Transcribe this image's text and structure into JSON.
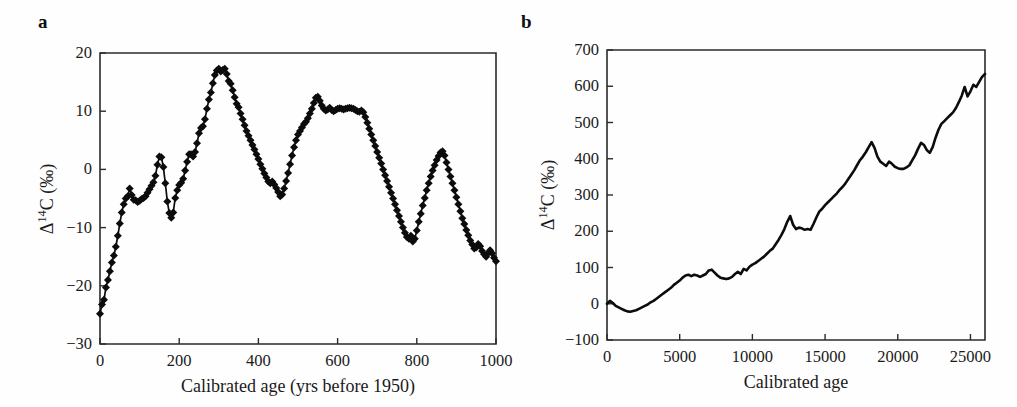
{
  "figure": {
    "background_color": "#fefefe",
    "line_color": "#0c0c0c",
    "axis_color": "#2b2b2b"
  },
  "panels": {
    "a": {
      "label": "a",
      "xlabel": "Calibrated age (yrs before 1950)",
      "ylabel_prefix": "Δ",
      "ylabel_sup": "14",
      "ylabel_suffix": "C (‰)",
      "ylabel_full": "Δ14C (‰)"
    },
    "b": {
      "label": "b",
      "xlabel": "Calibrated age",
      "ylabel_prefix": "Δ",
      "ylabel_sup": "14",
      "ylabel_suffix": "C (‰)",
      "ylabel_full": "Δ14C (‰)"
    }
  },
  "chart_data": [
    {
      "id": "panel-a",
      "type": "line",
      "title": "a",
      "xlabel": "Calibrated age (yrs before 1950)",
      "ylabel": "Δ14C (‰)",
      "xlim": [
        0,
        1000
      ],
      "ylim": [
        -30,
        20
      ],
      "xticks": [
        0,
        200,
        400,
        600,
        800,
        1000
      ],
      "yticks": [
        -30,
        -20,
        -10,
        0,
        10,
        20
      ],
      "grid": false,
      "legend": null,
      "markers": "filled-diamond",
      "marker_size_px": 4,
      "series": [
        {
          "name": "Delta14C tree-ring record",
          "x": [
            0,
            5,
            10,
            15,
            20,
            25,
            30,
            35,
            40,
            45,
            50,
            55,
            60,
            65,
            70,
            75,
            80,
            85,
            90,
            95,
            100,
            105,
            110,
            115,
            120,
            125,
            130,
            135,
            140,
            145,
            150,
            155,
            160,
            165,
            170,
            175,
            180,
            185,
            190,
            195,
            200,
            205,
            210,
            215,
            220,
            225,
            230,
            235,
            240,
            245,
            250,
            255,
            260,
            265,
            270,
            275,
            280,
            285,
            290,
            295,
            300,
            305,
            310,
            315,
            320,
            325,
            330,
            335,
            340,
            345,
            350,
            355,
            360,
            365,
            370,
            375,
            380,
            385,
            390,
            395,
            400,
            405,
            410,
            415,
            420,
            425,
            430,
            435,
            440,
            445,
            450,
            455,
            460,
            465,
            470,
            475,
            480,
            485,
            490,
            495,
            500,
            505,
            510,
            515,
            520,
            525,
            530,
            535,
            540,
            545,
            550,
            555,
            560,
            565,
            570,
            575,
            580,
            585,
            590,
            595,
            600,
            605,
            610,
            615,
            620,
            625,
            630,
            635,
            640,
            645,
            650,
            655,
            660,
            665,
            670,
            675,
            680,
            685,
            690,
            695,
            700,
            705,
            710,
            715,
            720,
            725,
            730,
            735,
            740,
            745,
            750,
            755,
            760,
            765,
            770,
            775,
            780,
            785,
            790,
            795,
            800,
            805,
            810,
            815,
            820,
            825,
            830,
            835,
            840,
            845,
            850,
            855,
            860,
            865,
            870,
            875,
            880,
            885,
            890,
            895,
            900,
            905,
            910,
            915,
            920,
            925,
            930,
            935,
            940,
            945,
            950,
            955,
            960,
            965,
            970,
            975,
            980,
            985,
            990,
            995,
            1000
          ],
          "y": [
            -24.8,
            -23.2,
            -22.4,
            -20.3,
            -19.0,
            -17.5,
            -16.0,
            -14.8,
            -13.3,
            -11.4,
            -9.3,
            -7.4,
            -6.0,
            -5.0,
            -4.6,
            -3.3,
            -4.4,
            -5.2,
            -5.3,
            -5.6,
            -5.4,
            -5.1,
            -4.9,
            -4.6,
            -4.0,
            -3.4,
            -2.8,
            -2.2,
            -1.1,
            0.8,
            2.2,
            2.1,
            0.4,
            -2.4,
            -5.5,
            -7.5,
            -8.3,
            -7.4,
            -4.9,
            -3.6,
            -2.7,
            -2.3,
            -1.6,
            -0.2,
            1.3,
            2.6,
            2.6,
            2.2,
            3.0,
            4.5,
            6.2,
            7.1,
            7.4,
            8.6,
            10.4,
            12.0,
            13.2,
            14.8,
            16.2,
            17.0,
            17.3,
            16.8,
            17.1,
            17.3,
            16.4,
            15.2,
            14.7,
            13.6,
            12.4,
            11.3,
            10.7,
            9.6,
            8.6,
            7.6,
            6.6,
            5.8,
            5.0,
            4.2,
            3.4,
            2.6,
            1.8,
            0.9,
            0.1,
            -0.7,
            -1.4,
            -2.1,
            -2.4,
            -2.1,
            -2.6,
            -3.2,
            -3.9,
            -4.6,
            -4.3,
            -3.3,
            -2.0,
            -0.6,
            0.9,
            2.4,
            3.8,
            5.0,
            6.0,
            6.6,
            7.2,
            7.8,
            8.2,
            8.8,
            9.6,
            10.4,
            11.4,
            12.3,
            12.5,
            11.8,
            11.0,
            10.4,
            10.1,
            10.3,
            10.6,
            10.2,
            10.0,
            10.2,
            10.4,
            10.5,
            10.4,
            10.3,
            10.4,
            10.5,
            10.6,
            10.5,
            10.4,
            10.2,
            10.0,
            9.9,
            10.1,
            9.8,
            9.0,
            8.0,
            7.0,
            6.0,
            5.0,
            4.0,
            3.0,
            2.0,
            1.0,
            0.0,
            -1.0,
            -2.0,
            -3.0,
            -4.0,
            -5.0,
            -6.0,
            -7.0,
            -8.0,
            -9.0,
            -10.0,
            -10.9,
            -11.6,
            -11.9,
            -11.4,
            -12.4,
            -11.9,
            -10.5,
            -9.0,
            -7.6,
            -6.2,
            -4.9,
            -3.6,
            -2.4,
            -1.2,
            -0.2,
            0.7,
            1.6,
            2.3,
            2.9,
            3.1,
            2.4,
            1.2,
            0.0,
            -1.2,
            -2.4,
            -3.6,
            -4.8,
            -6.0,
            -7.2,
            -8.4,
            -9.4,
            -10.4,
            -11.3,
            -12.2,
            -12.9,
            -13.6,
            -13.4,
            -12.8,
            -13.2,
            -14.0,
            -14.6,
            -15.0,
            -14.4,
            -13.9,
            -14.4,
            -15.2,
            -15.8,
            -16.2,
            -16.1,
            -15.7,
            -15.4,
            -15.6,
            -16.2,
            -16.4,
            -16.5,
            -16.2,
            -16.6,
            -17.2,
            -17.7,
            -16.6,
            -15.8,
            -15.2,
            -15.4,
            -16.0,
            -16.4,
            -15.9,
            -15.4,
            -15.8,
            -16.6,
            -17.3,
            -17.9,
            -18.5,
            -19.3,
            -20.2,
            -21.0,
            -20.0,
            -19.0,
            -18.4,
            -18.0,
            -17.6,
            -17.2,
            -17.4,
            -17.0,
            -16.4,
            -16.8,
            -17.0,
            -16.6,
            -16.0,
            -15.0,
            -14.0,
            -13.0,
            -12.0,
            -11.0,
            -10.0,
            -9.0,
            -8.0,
            -7.0,
            -6.2,
            -5.6,
            -5.2,
            -5.6,
            -6.4,
            -7.6,
            -8.8,
            -10.0,
            -11.2,
            -12.2,
            -13.0,
            -13.8,
            -14.2,
            -13.8,
            -14.4,
            -15.0,
            -15.4,
            -14.9,
            -15.4,
            -16.0,
            -16.4,
            -16.8,
            -17.0,
            -16.8,
            -17.2,
            -17.6,
            -18.0,
            -18.4,
            -18.8,
            -19.2,
            -19.0,
            -18.6,
            -18.2,
            -17.8
          ]
        }
      ]
    },
    {
      "id": "panel-b",
      "type": "line",
      "title": "b",
      "xlabel": "Calibrated age",
      "ylabel": "Δ14C (‰)",
      "xlim": [
        0,
        26000
      ],
      "ylim": [
        -100,
        700
      ],
      "xticks": [
        0,
        5000,
        10000,
        15000,
        20000,
        25000
      ],
      "yticks": [
        -100,
        0,
        100,
        200,
        300,
        400,
        500,
        600,
        700
      ],
      "grid": false,
      "legend": null,
      "markers": "none",
      "series": [
        {
          "name": "Delta14C calibration record",
          "x": [
            0,
            200,
            400,
            600,
            800,
            1000,
            1200,
            1400,
            1600,
            1800,
            2000,
            2200,
            2400,
            2600,
            2800,
            3000,
            3200,
            3400,
            3600,
            3800,
            4000,
            4200,
            4400,
            4600,
            4800,
            5000,
            5200,
            5400,
            5600,
            5800,
            6000,
            6200,
            6400,
            6600,
            6800,
            7000,
            7200,
            7400,
            7600,
            7800,
            8000,
            8200,
            8400,
            8600,
            8800,
            9000,
            9200,
            9400,
            9600,
            9800,
            10000,
            10200,
            10400,
            10600,
            10800,
            11000,
            11200,
            11400,
            11600,
            11800,
            12000,
            12200,
            12400,
            12600,
            12800,
            13000,
            13200,
            13400,
            13600,
            13800,
            14000,
            14200,
            14400,
            14600,
            14800,
            15000,
            15200,
            15400,
            15600,
            15800,
            16000,
            16200,
            16400,
            16600,
            16800,
            17000,
            17200,
            17400,
            17600,
            17800,
            18000,
            18200,
            18400,
            18600,
            18800,
            19000,
            19200,
            19400,
            19600,
            19800,
            20000,
            20200,
            20400,
            20600,
            20800,
            21000,
            21200,
            21400,
            21600,
            21800,
            22000,
            22200,
            22400,
            22600,
            22800,
            23000,
            23200,
            23400,
            23600,
            23800,
            24000,
            24200,
            24400,
            24600,
            24800,
            25000,
            25200,
            25400,
            25600,
            25800,
            26000
          ],
          "y": [
            0,
            8,
            2,
            -6,
            -10,
            -14,
            -18,
            -21,
            -22,
            -20,
            -18,
            -14,
            -10,
            -6,
            -2,
            4,
            8,
            14,
            20,
            26,
            32,
            38,
            44,
            52,
            58,
            64,
            72,
            78,
            80,
            76,
            80,
            78,
            74,
            78,
            82,
            92,
            94,
            86,
            78,
            72,
            70,
            68,
            70,
            74,
            82,
            88,
            82,
            96,
            92,
            102,
            108,
            112,
            118,
            124,
            130,
            138,
            146,
            152,
            164,
            176,
            190,
            206,
            226,
            242,
            218,
            206,
            210,
            208,
            204,
            206,
            204,
            220,
            238,
            254,
            262,
            272,
            280,
            288,
            296,
            304,
            314,
            322,
            332,
            344,
            356,
            368,
            382,
            396,
            406,
            418,
            432,
            446,
            430,
            406,
            392,
            386,
            380,
            392,
            386,
            378,
            374,
            372,
            372,
            376,
            382,
            396,
            410,
            428,
            444,
            438,
            424,
            416,
            432,
            458,
            480,
            496,
            504,
            512,
            520,
            528,
            540,
            556,
            574,
            598,
            572,
            586,
            604,
            598,
            612,
            626,
            634
          ]
        }
      ]
    }
  ]
}
